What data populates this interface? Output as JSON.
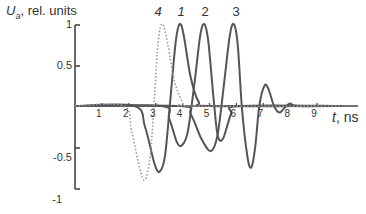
{
  "chart_data": {
    "type": "line",
    "title": "",
    "ylabel_var": "U",
    "ylabel_sub": "a",
    "ylabel_rest": ", rel. units",
    "xlabel_var": "t",
    "xlabel_rest": ", ns",
    "xlim": [
      0,
      10
    ],
    "ylim": [
      -1,
      1
    ],
    "x_ticks": [
      "1",
      "2",
      "3",
      "4",
      "5",
      "6",
      "7",
      "8",
      "9"
    ],
    "y_ticks": [
      "1",
      "0.5",
      "-0.5",
      "-1"
    ],
    "grid": false,
    "legend": "curve labels above peaks",
    "series": [
      {
        "name": "1",
        "style": "solid",
        "points": [
          [
            0,
            0
          ],
          [
            2.2,
            0
          ],
          [
            2.6,
            -0.25
          ],
          [
            2.95,
            -0.7
          ],
          [
            3.15,
            -0.8
          ],
          [
            3.35,
            -0.6
          ],
          [
            3.55,
            0.1
          ],
          [
            3.75,
            0.8
          ],
          [
            3.9,
            1.0
          ],
          [
            4.05,
            0.85
          ],
          [
            4.3,
            0.35
          ],
          [
            4.6,
            0.05
          ],
          [
            5.0,
            0
          ],
          [
            10,
            0
          ]
        ]
      },
      {
        "name": "2",
        "style": "solid",
        "points": [
          [
            0,
            0
          ],
          [
            3.2,
            0
          ],
          [
            3.5,
            -0.15
          ],
          [
            3.8,
            -0.45
          ],
          [
            4.0,
            -0.47
          ],
          [
            4.2,
            -0.3
          ],
          [
            4.45,
            0.3
          ],
          [
            4.65,
            0.85
          ],
          [
            4.8,
            1.0
          ],
          [
            4.95,
            0.8
          ],
          [
            5.15,
            0.1
          ],
          [
            5.3,
            -0.35
          ],
          [
            5.5,
            -0.4
          ],
          [
            5.8,
            -0.1
          ],
          [
            6.1,
            0
          ],
          [
            10,
            0
          ]
        ]
      },
      {
        "name": "3",
        "style": "solid",
        "points": [
          [
            0,
            0
          ],
          [
            3.9,
            0
          ],
          [
            4.3,
            -0.1
          ],
          [
            4.7,
            -0.4
          ],
          [
            5.05,
            -0.55
          ],
          [
            5.3,
            -0.35
          ],
          [
            5.55,
            0.3
          ],
          [
            5.75,
            0.85
          ],
          [
            5.9,
            1.0
          ],
          [
            6.05,
            0.75
          ],
          [
            6.2,
            0.0
          ],
          [
            6.4,
            -0.6
          ],
          [
            6.55,
            -0.75
          ],
          [
            6.7,
            -0.5
          ],
          [
            6.85,
            0.0
          ],
          [
            7.05,
            0.25
          ],
          [
            7.2,
            0.2
          ],
          [
            7.4,
            0.0
          ],
          [
            7.6,
            -0.08
          ],
          [
            7.8,
            -0.02
          ],
          [
            8.0,
            0.03
          ],
          [
            8.3,
            0.0
          ],
          [
            10,
            0
          ]
        ]
      },
      {
        "name": "4",
        "style": "dotted",
        "points": [
          [
            0,
            0
          ],
          [
            1.8,
            0
          ],
          [
            2.1,
            -0.3
          ],
          [
            2.4,
            -0.75
          ],
          [
            2.6,
            -0.9
          ],
          [
            2.8,
            -0.6
          ],
          [
            2.95,
            0.1
          ],
          [
            3.1,
            0.8
          ],
          [
            3.25,
            1.0
          ],
          [
            3.45,
            0.75
          ],
          [
            3.7,
            0.3
          ],
          [
            4.0,
            0.05
          ],
          [
            4.3,
            0
          ],
          [
            10,
            0
          ]
        ]
      }
    ]
  }
}
